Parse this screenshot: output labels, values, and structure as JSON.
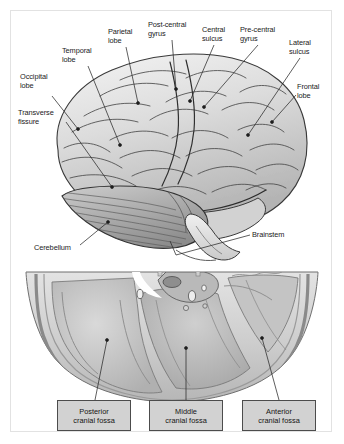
{
  "figure": {
    "frame_color": "#e2e2e2",
    "background": "#ffffff",
    "text_color": "#1b1b1b",
    "box_fill": "#d2d2d2",
    "box_border": "#4c4c4c",
    "leader_color": "#2a2a2a"
  },
  "labels": [
    {
      "name": "occipital-lobe",
      "text": "Occipital\nlobe",
      "x": 20,
      "y": 73,
      "w": 48
    },
    {
      "name": "transverse-fissure",
      "text": "Transverse\nfissure",
      "x": 18,
      "y": 109,
      "w": 54
    },
    {
      "name": "temporal-lobe",
      "text": "Temporal\nlobe",
      "x": 62,
      "y": 47,
      "w": 44
    },
    {
      "name": "parietal-lobe",
      "text": "Parietal\nlobe",
      "x": 108,
      "y": 28,
      "w": 40
    },
    {
      "name": "post-central-gyrus",
      "text": "Post-central\ngyrus",
      "x": 148,
      "y": 21,
      "w": 54
    },
    {
      "name": "central-sulcus",
      "text": "Central\nsulcus",
      "x": 202,
      "y": 26,
      "w": 40
    },
    {
      "name": "pre-central-gyrus",
      "text": "Pre-central\ngyrus",
      "x": 240,
      "y": 26,
      "w": 52
    },
    {
      "name": "lateral-sulcus",
      "text": "Lateral\nsulcus",
      "x": 289,
      "y": 39,
      "w": 40
    },
    {
      "name": "frontal-lobe",
      "text": "Frontal\nlobe",
      "x": 297,
      "y": 83,
      "w": 38
    },
    {
      "name": "cerebellum",
      "text": "Cerebellum",
      "x": 34,
      "y": 244,
      "w": 56
    },
    {
      "name": "brainstem",
      "text": "Brainstem",
      "x": 252,
      "y": 231,
      "w": 50
    }
  ],
  "fossa_boxes": [
    {
      "name": "posterior-cranial-fossa",
      "text": "Posterior\ncranial fossa",
      "x": 57,
      "y": 400,
      "w": 74,
      "h": 31
    },
    {
      "name": "middle-cranial-fossa",
      "text": "Middle\ncranial fossa",
      "x": 149,
      "y": 400,
      "w": 74,
      "h": 31
    },
    {
      "name": "anterior-cranial-fossa",
      "text": "Anterior\ncranial fossa",
      "x": 242,
      "y": 400,
      "w": 74,
      "h": 31
    }
  ]
}
